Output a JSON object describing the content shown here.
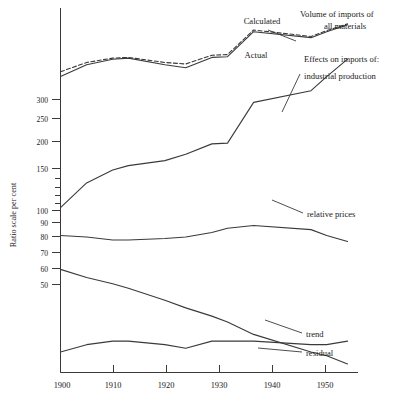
{
  "chart_data": {
    "type": "line",
    "title": "",
    "xlabel": "",
    "ylabel": "Ratio scale per cent",
    "scale": "log",
    "grid": false,
    "legend_position": "inline-annotations",
    "xlim": [
      1900,
      1957
    ],
    "ylim": [
      28,
      520
    ],
    "x_ticks": [
      "1900",
      "1910",
      "1920",
      "1930",
      "1940",
      "1950"
    ],
    "x_tick_values": [
      1900,
      1910,
      1920,
      1930,
      1940,
      1950
    ],
    "y_ticks": [
      "300",
      "250",
      "200",
      "150",
      "100",
      "90",
      "80",
      "70",
      "60",
      "50"
    ],
    "y_tick_values": [
      300,
      250,
      200,
      150,
      100,
      90,
      80,
      70,
      60,
      50
    ],
    "x": [
      1900,
      1905,
      1910,
      1913,
      1920,
      1924,
      1929,
      1932,
      1937,
      1948,
      1951,
      1955
    ],
    "series": [
      {
        "name": "Actual",
        "style": "solid",
        "label": "Actual",
        "values": [
          300,
          330,
          345,
          348,
          330,
          322,
          350,
          352,
          430,
          410,
          430,
          455
        ]
      },
      {
        "name": "Calculated",
        "style": "dashed",
        "label": "Calculated",
        "values": [
          312,
          336,
          348,
          350,
          336,
          332,
          356,
          358,
          436,
          414,
          434,
          458
        ]
      },
      {
        "name": "industrial production",
        "style": "solid",
        "label": "industrial production",
        "values": [
          105,
          128,
          142,
          147,
          153,
          161,
          175,
          176,
          244,
          268,
          300,
          345
        ]
      },
      {
        "name": "relative prices",
        "style": "solid",
        "label": "relative prices",
        "values": [
          84,
          83,
          81,
          81,
          82,
          83,
          86,
          89,
          91,
          88,
          84,
          80
        ]
      },
      {
        "name": "trend",
        "style": "solid",
        "label": "trend",
        "values": [
          64,
          60,
          57,
          55,
          50,
          47,
          44,
          42,
          38,
          33,
          32,
          30
        ]
      },
      {
        "name": "residual",
        "style": "solid",
        "label": "residual",
        "values": [
          33,
          35,
          36,
          36,
          35,
          34,
          36,
          36,
          36,
          35,
          35,
          36
        ]
      }
    ],
    "annotations": [
      {
        "id": "calculated",
        "text": "Calculated"
      },
      {
        "id": "actual",
        "text": "Actual"
      },
      {
        "id": "volume-line1",
        "text": "Volume of imports of"
      },
      {
        "id": "volume-line2",
        "text": "all materials"
      },
      {
        "id": "effects-line1",
        "text": "Effects on imports of:"
      },
      {
        "id": "effects-line2",
        "text": "industrial production"
      },
      {
        "id": "relative-prices",
        "text": "relative prices"
      },
      {
        "id": "trend",
        "text": "trend"
      },
      {
        "id": "residual",
        "text": "residual"
      }
    ]
  }
}
